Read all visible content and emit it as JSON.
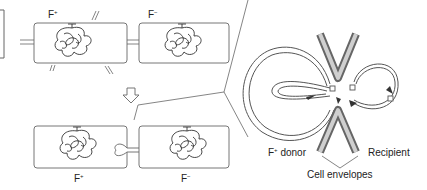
{
  "diagram": {
    "type": "bacterial-conjugation",
    "top_row": {
      "left_cell": {
        "label": "F",
        "sup": "+"
      },
      "right_cell": {
        "label": "F",
        "sup": "−"
      }
    },
    "arrow": "down-arrow",
    "bottom_row": {
      "left_cell": {
        "label": "F",
        "sup": "+"
      },
      "right_cell": {
        "label": "F",
        "sup": "−"
      }
    },
    "detail": {
      "donor_label": "F",
      "donor_sup": "+",
      "donor_suffix": " donor",
      "recipient_label": "Recipient",
      "envelopes_label": "Cell envelopes"
    }
  },
  "colors": {
    "stroke": "#555555",
    "envelope_dark": "#6e6e6e",
    "envelope_light": "#c8c8c8",
    "background": "#ffffff"
  }
}
